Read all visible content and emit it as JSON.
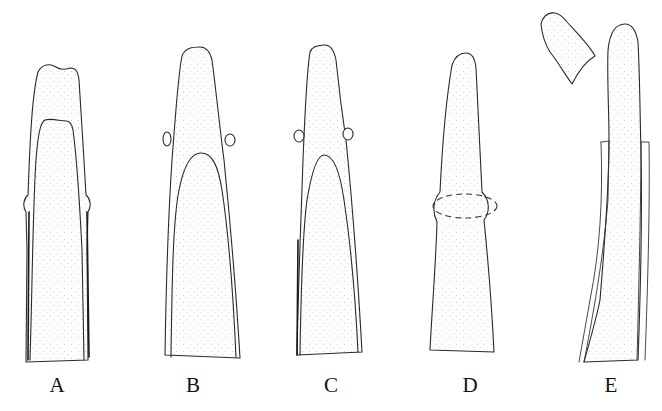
{
  "figure": {
    "type": "scientific line illustration (stippled)",
    "panels": [
      {
        "id": "A",
        "label": "A",
        "description": "Blunt notched tip with inner cap, lateral swellings near base of cap"
      },
      {
        "id": "B",
        "label": "B",
        "description": "Tapered tip with small lateral knobs, inner cap below"
      },
      {
        "id": "C",
        "label": "C",
        "description": "Tapered tip with small lateral knobs, narrower inner cap"
      },
      {
        "id": "D",
        "label": "D",
        "description": "Tapered tip with ring-like constriction shown by dashed ellipse"
      },
      {
        "id": "E",
        "label": "E",
        "description": "Elongated tip emerging from sheath, detached cap fragment above-left"
      }
    ]
  },
  "colors": {
    "line": "#2a2a2a",
    "stipple": "#9a9a9a",
    "background": "#ffffff"
  }
}
